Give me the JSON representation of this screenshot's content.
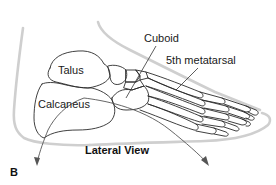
{
  "figure": {
    "panel_letter": "B",
    "caption": "Lateral View",
    "labels": {
      "talus": "Talus",
      "cuboid": "Cuboid",
      "fifth_metatarsal": "5th metatarsal",
      "calcaneus": "Calcaneus"
    },
    "colors": {
      "bone_outline": "#2a2a2a",
      "skin_outline": "#c8c8c8",
      "leader_line": "#333333",
      "arrow": "#555555",
      "text": "#1a1a1a"
    }
  }
}
